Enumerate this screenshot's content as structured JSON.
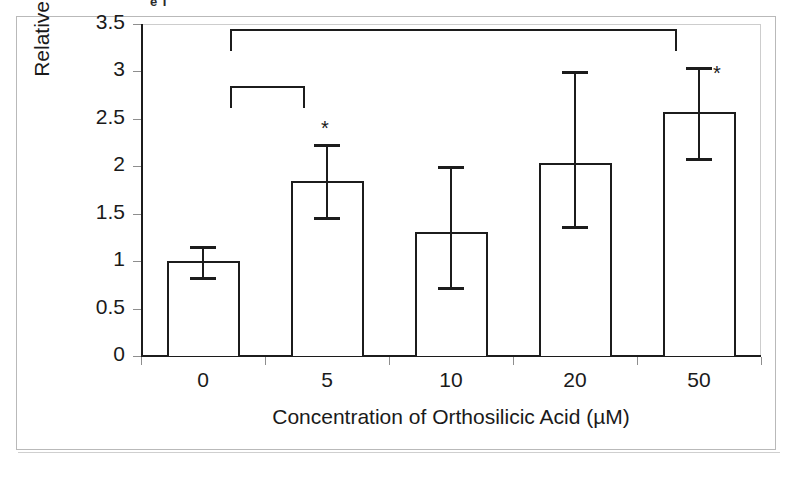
{
  "figure": {
    "caption_remnant": "e I",
    "frame_color": "#b9b9b9",
    "ink_color": "#1c1c1c",
    "background": "#ffffff"
  },
  "chart_data": {
    "type": "bar",
    "title": "",
    "subtitle": "",
    "xlabel": "Concentration of Orthosilicic Acid (µM)",
    "ylabel_line1": "Relative Increase in collagen type I",
    "ylabel_line2": "mRNA",
    "categories": [
      "0",
      "5",
      "10",
      "20",
      "50"
    ],
    "values": [
      1.0,
      1.85,
      1.31,
      2.03,
      2.57
    ],
    "error_low": [
      0.83,
      1.47,
      0.73,
      1.37,
      2.09
    ],
    "error_high": [
      1.16,
      2.23,
      2.0,
      3.0,
      3.05
    ],
    "significance_markers": [
      "",
      "*",
      "",
      "",
      "*"
    ],
    "ylim": [
      0,
      3.5
    ],
    "ytick_values": [
      0,
      0.5,
      1,
      1.5,
      2,
      2.5,
      3,
      3.5
    ],
    "ytick_labels": [
      "0",
      "0.5",
      "1",
      "1.5",
      "2",
      "2.5",
      "3",
      "3.5"
    ],
    "grid": false,
    "legend": "none",
    "bar_fill": "none",
    "bar_edge_color": "#1c1c1c",
    "annotations": [
      {
        "name": "bracket-0-vs-50",
        "from_category": "0",
        "to_category": "50",
        "level": 3.45
      },
      {
        "name": "bracket-0-vs-5",
        "from_category": "0",
        "to_category": "5",
        "level": 2.85
      }
    ]
  }
}
